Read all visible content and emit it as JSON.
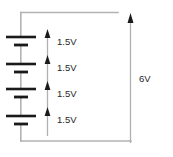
{
  "diagram": {
    "type": "series-battery-circuit",
    "colors": {
      "wire": "#b2b2b2",
      "plate": "#1a1a1a",
      "arrow_shaft": "#b0b0b0",
      "arrow_head": "#1a1a1a",
      "text": "#262626",
      "background": "#ffffff"
    },
    "cells": [
      {
        "label": "1.5V",
        "index": 1
      },
      {
        "label": "1.5V",
        "index": 2
      },
      {
        "label": "1.5V",
        "index": 3
      },
      {
        "label": "1.5V",
        "index": 4
      }
    ],
    "total": {
      "label": "6V"
    }
  }
}
